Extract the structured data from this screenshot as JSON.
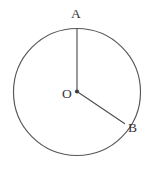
{
  "figure": {
    "kind": "geometry-diagram",
    "background_color": "#ffffff",
    "stroke_color": "#56565a",
    "label_color": "#343437",
    "canvas": {
      "width": 149,
      "height": 169
    },
    "circle": {
      "name": "circle-outline",
      "center_x": 77,
      "center_y": 92,
      "radius": 63.5
    },
    "center_point": {
      "name": "center-dot",
      "x": 77,
      "y": 91.5,
      "dot_radius": 2.1
    },
    "radii": [
      {
        "name": "radius-OA",
        "from_x": 77,
        "from_y": 91.5,
        "to_x": 77,
        "to_y": 28.6
      },
      {
        "name": "radius-OB",
        "from_x": 77,
        "from_y": 91.5,
        "to_x": 124.5,
        "to_y": 123.6
      }
    ],
    "labels": {
      "a": "A",
      "o": "O",
      "b": "B"
    }
  }
}
